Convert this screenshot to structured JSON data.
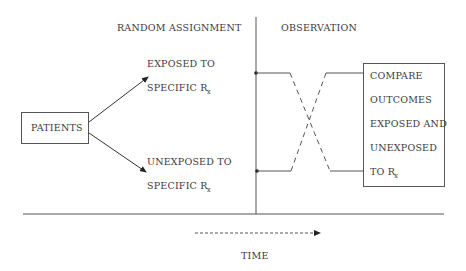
{
  "diagram": {
    "headers": {
      "random_assignment": "RANDOM ASSIGNMENT",
      "observation": "OBSERVATION"
    },
    "source_box": {
      "label": "PATIENTS"
    },
    "branches": {
      "exposed": {
        "line1": "EXPOSED TO",
        "line2_main": "SPECIFIC R",
        "line2_sub": "x"
      },
      "unexposed": {
        "line1": "UNEXPOSED TO",
        "line2_main": "SPECIFIC R",
        "line2_sub": "x"
      }
    },
    "outcome_box": {
      "lines": [
        "COMPARE",
        "OUTCOMES",
        "EXPOSED AND",
        "UNEXPOSED"
      ],
      "last_main": "TO R",
      "last_sub": "x"
    },
    "time_axis": {
      "label": "TIME"
    }
  }
}
